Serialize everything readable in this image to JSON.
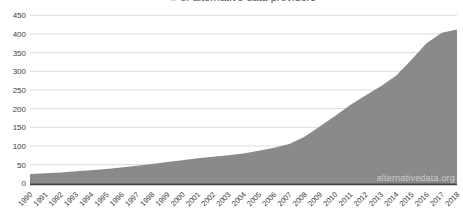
{
  "chart_data": {
    "type": "area",
    "title": "# of alternative data providers",
    "categories": [
      "1990",
      "1991",
      "1992",
      "1993",
      "1994",
      "1995",
      "1996",
      "1997",
      "1998",
      "1999",
      "2000",
      "2001",
      "2002",
      "2003",
      "2004",
      "2005",
      "2006",
      "2007",
      "2008",
      "2009",
      "2010",
      "2011",
      "2012",
      "2013",
      "2014",
      "2015",
      "2016",
      "2017",
      "2018"
    ],
    "values": [
      25,
      27,
      29,
      32,
      35,
      38,
      42,
      47,
      52,
      57,
      62,
      67,
      71,
      75,
      80,
      87,
      95,
      105,
      125,
      152,
      180,
      210,
      235,
      260,
      288,
      330,
      375,
      403,
      412
    ],
    "xlabel": "",
    "ylabel": "",
    "ylim": [
      0,
      450
    ],
    "yticks": [
      0,
      50,
      100,
      150,
      200,
      250,
      300,
      350,
      400,
      450
    ],
    "grid": true,
    "legend": "none",
    "watermark": "alternativedata.org"
  },
  "colors": {
    "background": "#ffffff",
    "area_fill": "#8a8a8a",
    "gridline": "#dcdcdc",
    "axis_line": "#404040",
    "tick_label": "#404040",
    "title_text": "#595959",
    "watermark_text": "rgba(255,255,255,0.58)"
  }
}
